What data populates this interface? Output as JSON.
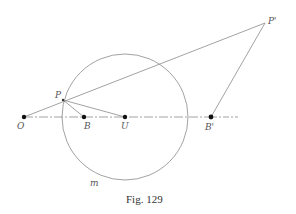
{
  "figure": {
    "caption": "Fig. 129",
    "colors": {
      "line": "#8a8a8a",
      "point": "#111111",
      "label": "#555555"
    }
  },
  "points": {
    "O": {
      "label": "O",
      "x": 24,
      "y": 117
    },
    "B": {
      "label": "B",
      "x": 84,
      "y": 117
    },
    "U": {
      "label": "U",
      "x": 125,
      "y": 117
    },
    "B_prime": {
      "label": "B'",
      "x": 211,
      "y": 117
    },
    "P": {
      "label": "P",
      "x": 63,
      "y": 100
    },
    "P_prime": {
      "label": "P'",
      "x": 265,
      "y": 23
    }
  },
  "circle": {
    "label": "m",
    "cx": 125,
    "cy": 117,
    "r": 63
  },
  "segments": [
    {
      "from": "O",
      "to": "P_prime",
      "style": "solid"
    },
    {
      "from": "P",
      "to": "B",
      "style": "solid"
    },
    {
      "from": "P",
      "to": "U",
      "style": "solid"
    },
    {
      "from": "P_prime",
      "to": "B_prime",
      "style": "solid"
    },
    {
      "from": "O",
      "to": "B_prime",
      "style": "solid"
    },
    {
      "from": "B_prime",
      "to": "end",
      "style": "dash-dot",
      "x2": 238
    }
  ]
}
